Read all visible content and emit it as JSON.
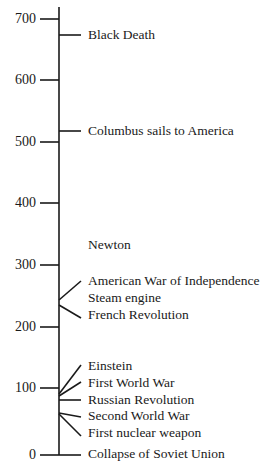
{
  "timeline": {
    "axis": {
      "ticks": [
        {
          "label": "700",
          "value": 700
        },
        {
          "label": "600",
          "value": 600
        },
        {
          "label": "500",
          "value": 500
        },
        {
          "label": "400",
          "value": 400
        },
        {
          "label": "300",
          "value": 300
        },
        {
          "label": "200",
          "value": 200
        },
        {
          "label": "100",
          "value": 100
        },
        {
          "label": "0",
          "value": 0
        }
      ]
    },
    "events": [
      {
        "label": "Black Death"
      },
      {
        "label": "Columbus sails to America"
      },
      {
        "label": "Newton"
      },
      {
        "label": "American War of Independence"
      },
      {
        "label": "Steam engine"
      },
      {
        "label": "French Revolution"
      },
      {
        "label": "Einstein"
      },
      {
        "label": "First World War"
      },
      {
        "label": "Russian Revolution"
      },
      {
        "label": "Second World War"
      },
      {
        "label": "First nuclear weapon"
      },
      {
        "label": "Collapse of Soviet Union"
      }
    ],
    "line_color": "#1a1a1a"
  }
}
